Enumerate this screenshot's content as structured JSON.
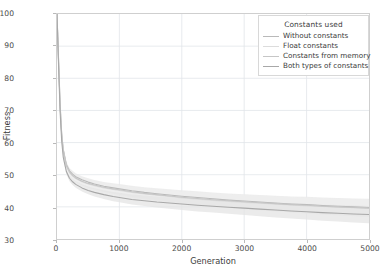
{
  "chart_data": {
    "type": "line",
    "title": "",
    "xlabel": "Generation",
    "ylabel": "Fitness",
    "xlim": [
      0,
      5000
    ],
    "ylim": [
      30,
      100
    ],
    "xticks": [
      0,
      1000,
      2000,
      3000,
      4000,
      5000
    ],
    "yticks": [
      30,
      40,
      50,
      60,
      70,
      80,
      90,
      100
    ],
    "grid": true,
    "legend_position": "upper right",
    "legend_title": "Constants used",
    "background": "#ffffff",
    "grid_color": "#e2e6ea",
    "frame_color": "#cfcfcf",
    "band_note": "each series drawn with a light shaded variability band around the mean line",
    "x": [
      0,
      25,
      50,
      75,
      100,
      150,
      200,
      250,
      300,
      400,
      500,
      600,
      750,
      900,
      1000,
      1200,
      1400,
      1600,
      1800,
      2000,
      2250,
      2500,
      2750,
      3000,
      3250,
      3500,
      3750,
      4000,
      4250,
      4500,
      4750,
      5000
    ],
    "series": [
      {
        "name": "Without constants",
        "color": "#b9b9b9",
        "band_color": "#e8e8e8",
        "values": [
          100,
          86,
          72,
          63,
          58,
          53.2,
          51.2,
          50.2,
          49.4,
          48.4,
          47.7,
          47.1,
          46.4,
          45.9,
          45.6,
          45.0,
          44.5,
          44.1,
          43.7,
          43.3,
          42.9,
          42.5,
          42.1,
          41.8,
          41.5,
          41.2,
          40.9,
          40.7,
          40.4,
          40.2,
          40.0,
          39.8
        ]
      },
      {
        "name": "Float constants",
        "color": "#dcdcdc",
        "band_color": "#f0f0f0",
        "values": [
          100,
          85,
          71,
          62.2,
          57.2,
          52.6,
          50.6,
          49.6,
          48.8,
          47.8,
          47.1,
          46.6,
          45.9,
          45.4,
          45.1,
          44.5,
          44.0,
          43.6,
          43.2,
          42.8,
          42.4,
          42.0,
          41.7,
          41.4,
          41.1,
          40.8,
          40.6,
          40.3,
          40.1,
          39.9,
          39.7,
          39.5
        ]
      },
      {
        "name": "Constants from memory",
        "color": "#c6c6c6",
        "band_color": "#ededed",
        "values": [
          100,
          85.5,
          71.5,
          62.6,
          57.6,
          52.9,
          50.9,
          49.8,
          49.0,
          48.0,
          47.3,
          46.8,
          46.1,
          45.6,
          45.3,
          44.7,
          44.2,
          43.8,
          43.4,
          43.0,
          42.6,
          42.2,
          41.9,
          41.6,
          41.3,
          41.0,
          40.7,
          40.5,
          40.2,
          40.0,
          39.8,
          39.6
        ]
      },
      {
        "name": "Both types of constants",
        "color": "#a8a8a8",
        "band_color": "#e4e4e4",
        "values": [
          100,
          84,
          69.5,
          60.5,
          55.5,
          51.0,
          48.9,
          47.8,
          47.0,
          45.9,
          45.1,
          44.5,
          43.8,
          43.2,
          42.9,
          42.3,
          41.9,
          41.5,
          41.2,
          40.9,
          40.5,
          40.2,
          39.9,
          39.6,
          39.3,
          39.0,
          38.7,
          38.5,
          38.2,
          38.0,
          37.8,
          37.6
        ]
      }
    ]
  }
}
